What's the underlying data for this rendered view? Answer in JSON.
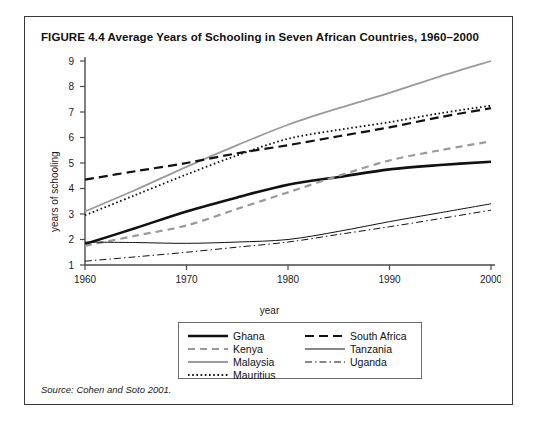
{
  "figure": {
    "title": "FIGURE 4.4  Average Years of Schooling in Seven African Countries, 1960–2000",
    "source": "Source: Cohen and Soto 2001."
  },
  "axes": {
    "xlabel": "year",
    "ylabel": "years of schooling",
    "xticks": [
      "1960",
      "1970",
      "1980",
      "1990",
      "2000"
    ],
    "yticks": [
      "1",
      "2",
      "3",
      "4",
      "5",
      "6",
      "7",
      "8",
      "9"
    ]
  },
  "legend": {
    "left": [
      {
        "label": "Ghana",
        "style": "thick-solid-black"
      },
      {
        "label": "Kenya",
        "style": "dashed-gray"
      },
      {
        "label": "Malaysia",
        "style": "thin-solid-gray"
      },
      {
        "label": "Mauritius",
        "style": "dotted-black"
      }
    ],
    "right": [
      {
        "label": "South Africa",
        "style": "dashed-black"
      },
      {
        "label": "Tanzania",
        "style": "thin-solid-black"
      },
      {
        "label": "Uganda",
        "style": "dashdot-black"
      }
    ]
  },
  "colors": {
    "black": "#111111",
    "gray": "#9a9a9a",
    "axis": "#4a4a4a",
    "frame": "#3a3a3a"
  },
  "chart_data": {
    "type": "line",
    "title": "FIGURE 4.4  Average Years of Schooling in Seven African Countries, 1960–2000",
    "xlabel": "year",
    "ylabel": "years of schooling",
    "x": [
      1960,
      1965,
      1970,
      1975,
      1980,
      1985,
      1990,
      1995,
      2000
    ],
    "xlim": [
      1960,
      2000
    ],
    "ylim": [
      1,
      9
    ],
    "grid": false,
    "legend_position": "below-plot",
    "series": [
      {
        "name": "Ghana",
        "style": "thick-solid-black",
        "values": [
          1.82,
          2.45,
          3.1,
          3.65,
          4.15,
          4.45,
          4.75,
          4.92,
          5.05
        ]
      },
      {
        "name": "Kenya",
        "style": "dashed-gray",
        "values": [
          1.75,
          2.15,
          2.55,
          3.2,
          3.85,
          4.5,
          5.1,
          5.5,
          5.85
        ]
      },
      {
        "name": "Malaysia",
        "style": "thin-solid-gray",
        "values": [
          3.1,
          3.95,
          4.85,
          5.7,
          6.5,
          7.15,
          7.75,
          8.4,
          9.0
        ]
      },
      {
        "name": "Mauritius",
        "style": "dotted-black",
        "values": [
          2.95,
          3.75,
          4.55,
          5.3,
          5.95,
          6.3,
          6.6,
          6.95,
          7.25
        ]
      },
      {
        "name": "South Africa",
        "style": "dashed-black",
        "values": [
          4.35,
          4.68,
          5.0,
          5.38,
          5.7,
          6.05,
          6.4,
          6.8,
          7.15
        ]
      },
      {
        "name": "Tanzania",
        "style": "thin-solid-black",
        "values": [
          1.9,
          1.88,
          1.85,
          1.9,
          2.0,
          2.32,
          2.7,
          3.05,
          3.4
        ]
      },
      {
        "name": "Uganda",
        "style": "dashdot-black",
        "values": [
          1.15,
          1.32,
          1.5,
          1.7,
          1.9,
          2.2,
          2.5,
          2.82,
          3.15
        ]
      }
    ]
  }
}
